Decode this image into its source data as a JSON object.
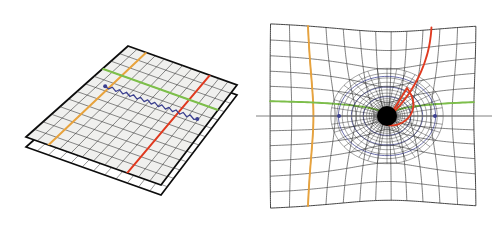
{
  "figure": {
    "title": "Flat spacetime grid and curved spacetime grid around a black hole",
    "background_color": "#ffffff",
    "width": 499,
    "height": 230,
    "panel_count": 2
  },
  "palette": {
    "grid_line": "#3a3a3a",
    "grid_fill": "#f0f0ee",
    "plane_edge": "#0d0d0d",
    "orange": "#e8a33d",
    "green": "#7dbf4a",
    "red": "#e03a20",
    "blue": "#3b3f8f",
    "axis_gray": "#808080",
    "singularity": "#000000",
    "white": "#ffffff"
  },
  "left_panel": {
    "name": "flat-spacetime-panel",
    "description": "Two stacked flat square sheets drawn in oblique perspective, ruled with a square grid",
    "sheets": [
      {
        "label": "upper-sheet",
        "grid_divisions": 12,
        "fill": "#f0f0ee"
      },
      {
        "label": "lower-sheet",
        "grid_divisions": 12,
        "fill": "#ffffff"
      }
    ],
    "grid": {
      "rows": 12,
      "cols": 12,
      "line_color": "#3a3a3a",
      "line_width": 0.6
    },
    "marked_lines": [
      {
        "name": "orange-gridline",
        "color": "#e8a33d",
        "orientation": "near-vertical",
        "width": 2.1
      },
      {
        "name": "red-gridline",
        "color": "#e03a20",
        "orientation": "near-vertical",
        "width": 2.1
      },
      {
        "name": "green-gridline",
        "color": "#7dbf4a",
        "orientation": "near-horizontal",
        "width": 2.1
      }
    ],
    "light_path": {
      "name": "blue-light-ray",
      "color": "#3b3f8f",
      "style": "zigzag",
      "zigzag_segments": 26,
      "endpoint_markers": 2,
      "marker_radius": 1.8,
      "description": "Straight zigzag ray travelling across the flat sheet between two dot markers"
    }
  },
  "right_panel": {
    "name": "curved-spacetime-panel",
    "description": "Single sheet warped by a central point mass; grid lines bend inward toward a black singularity",
    "grid": {
      "rows": 12,
      "cols": 12,
      "line_color": "#3a3a3a",
      "line_width": 0.6
    },
    "singularity": {
      "name": "black-hole-core",
      "color": "#000000",
      "radius": 10,
      "center_x": 387,
      "center_y": 116,
      "dense_rings": 16,
      "dense_spokes": 36
    },
    "marked_lines": [
      {
        "name": "orange-curve",
        "color": "#e8a33d",
        "orientation": "vertical-left",
        "width": 2.1
      },
      {
        "name": "red-curve",
        "color": "#e03a20",
        "orientation": "vertical-right-spiralling-in",
        "width": 2.1
      },
      {
        "name": "green-curve",
        "color": "#7dbf4a",
        "orientation": "horizontal-bending-around-core",
        "width": 2.1
      }
    ],
    "axis_line": {
      "name": "horizontal-axis",
      "color": "#808080",
      "width": 1.0
    },
    "blue_markers": {
      "name": "blue-dot-pair",
      "color": "#3b3f8f",
      "count": 2,
      "radius": 2.0,
      "positions": "symmetric left and right of the singularity on the horizontal axis"
    },
    "blue_orbit_curves": {
      "name": "blue-orbit-rings",
      "color": "#3b3f8f",
      "count": 3,
      "width": 0.9
    }
  }
}
